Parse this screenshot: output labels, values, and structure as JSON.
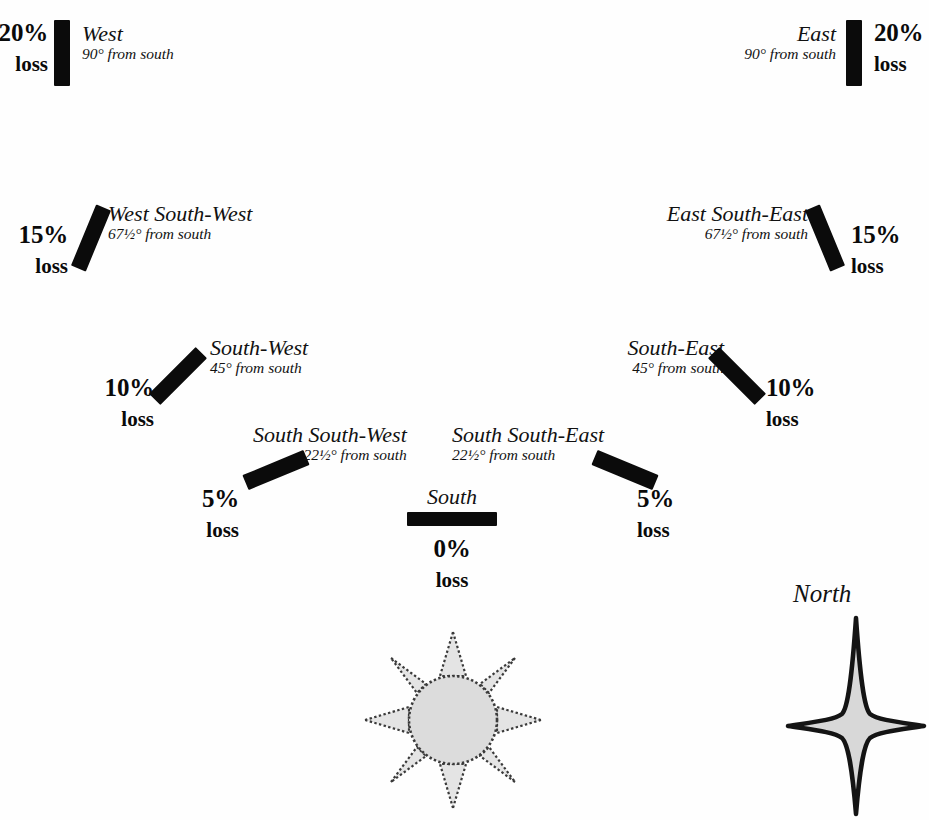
{
  "diagram": {
    "bar_color": "#0b0b0b",
    "background_color": "#fefefe",
    "loss_word": "loss",
    "orientations": [
      {
        "key": "west",
        "name": "West",
        "angle": "90° from south",
        "loss": "20%",
        "loss_word": "loss",
        "tilt_deg": 0
      },
      {
        "key": "west-south-west",
        "name": "West South-West",
        "angle": "67½° from south",
        "loss": "15%",
        "loss_word": "loss",
        "tilt_deg": 22.5
      },
      {
        "key": "south-west",
        "name": "South-West",
        "angle": "45° from south",
        "loss": "10%",
        "loss_word": "loss",
        "tilt_deg": 45
      },
      {
        "key": "south-south-west",
        "name": "South South-West",
        "angle": "22½° from south",
        "loss": "5%",
        "loss_word": "loss",
        "tilt_deg": 67.5
      },
      {
        "key": "south",
        "name": "South",
        "angle": "",
        "loss": "0%",
        "loss_word": "loss",
        "tilt_deg": 90
      },
      {
        "key": "south-south-east",
        "name": "South South-East",
        "angle": "22½° from south",
        "loss": "5%",
        "loss_word": "loss",
        "tilt_deg": -67.5
      },
      {
        "key": "south-east",
        "name": "South-East",
        "angle": "45° from south",
        "loss": "10%",
        "loss_word": "loss",
        "tilt_deg": -45
      },
      {
        "key": "east-south-east",
        "name": "East South-East",
        "angle": "67½° from south",
        "loss": "15%",
        "loss_word": "loss",
        "tilt_deg": -22.5
      },
      {
        "key": "east",
        "name": "East",
        "angle": "90° from south",
        "loss": "20%",
        "loss_word": "loss",
        "tilt_deg": 0
      }
    ],
    "compass": {
      "label": "North",
      "star_fill": "#d8d8d8",
      "star_stroke": "#111111"
    },
    "sun": {
      "disc_fill": "#dcdcdc",
      "ray_fill": "#e2e2e2",
      "outline": "#333333",
      "ray_count": 8
    }
  }
}
